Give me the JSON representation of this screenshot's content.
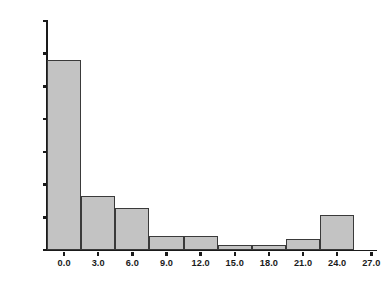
{
  "chart_data": {
    "type": "bar",
    "title": "",
    "subtitle": "",
    "xlabel": "",
    "ylabel": "",
    "grid": false,
    "legend": "none",
    "xlim": [
      -1.5,
      27.5
    ],
    "ylim": [
      0,
      14000
    ],
    "bar_fill_color": "#c3c3c3",
    "bar_edge_color": "#3a3a3a",
    "axis_color": "#1a1a1a",
    "background_color": "#ffffff",
    "bin_width": 3.0,
    "x_ticks": [
      0.0,
      3.0,
      6.0,
      9.0,
      12.0,
      15.0,
      18.0,
      21.0,
      24.0,
      27.0
    ],
    "x_tick_labels": [
      "0.0",
      "3.0",
      "6.0",
      "9.0",
      "12.0",
      "15.0",
      "18.0",
      "21.0",
      "24.0",
      "27.0"
    ],
    "y_ticks": [
      0,
      2000,
      4000,
      6000,
      8000,
      10000,
      12000,
      14000
    ],
    "y_tick_labels": [
      "0",
      "2000",
      "4000",
      "6000",
      "8000",
      "10000",
      "12000",
      "14000"
    ],
    "categories": [
      "0.0",
      "3.0",
      "6.0",
      "9.0",
      "12.0",
      "15.0",
      "18.0",
      "21.0",
      "24.0"
    ],
    "bin_starts": [
      -1.5,
      1.5,
      4.5,
      7.5,
      10.5,
      13.5,
      16.5,
      19.5,
      22.5
    ],
    "bin_ends": [
      1.5,
      4.5,
      7.5,
      10.5,
      13.5,
      16.5,
      19.5,
      22.5,
      25.5
    ],
    "values": [
      11620,
      3310,
      2540,
      870,
      870,
      280,
      280,
      700,
      2140
    ]
  }
}
